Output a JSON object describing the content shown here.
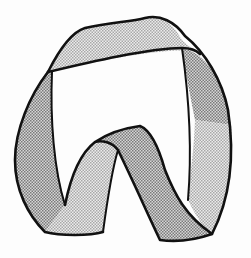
{
  "figure": {
    "colors": {
      "background": "#fdfdfd",
      "outline": "#111111",
      "dark_hatch": "#9a9a9a",
      "light_hatch": "#c8c8c8"
    }
  }
}
